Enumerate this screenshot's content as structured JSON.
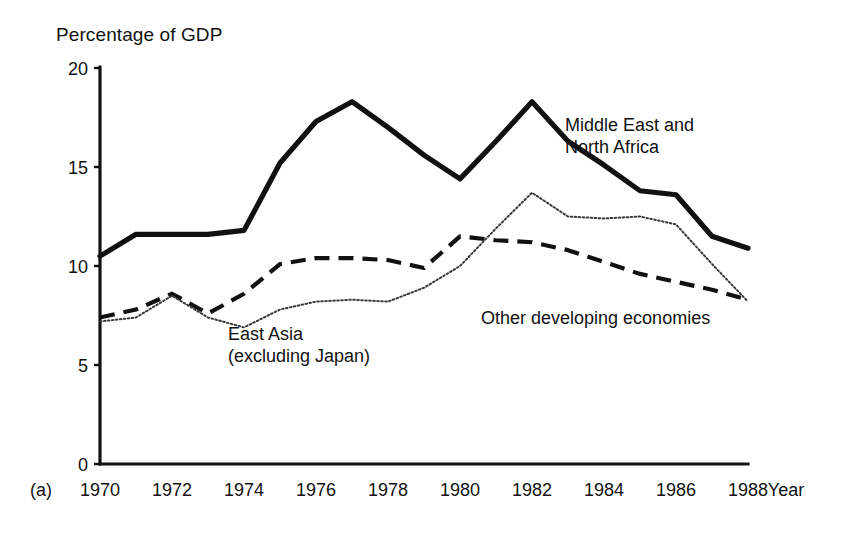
{
  "figure": {
    "panel_label": "(a)",
    "y_axis_title": "Percentage of GDP",
    "x_axis_title": "Year"
  },
  "chart_data": {
    "type": "line",
    "title": "Percentage of GDP",
    "xlabel": "Year",
    "ylabel": "Percentage of GDP",
    "xlim": [
      1970,
      1988
    ],
    "ylim": [
      0,
      20
    ],
    "grid": false,
    "legend": "inline-annotations",
    "x": [
      1970,
      1971,
      1972,
      1973,
      1974,
      1975,
      1976,
      1977,
      1978,
      1979,
      1980,
      1981,
      1982,
      1983,
      1984,
      1985,
      1986,
      1987,
      1988
    ],
    "xticks": [
      1970,
      1972,
      1974,
      1976,
      1978,
      1980,
      1982,
      1984,
      1986,
      1988
    ],
    "xtick_labels": [
      "1970",
      "1972",
      "1974",
      "1976",
      "1978",
      "1980",
      "1982",
      "1984",
      "1986",
      "1988"
    ],
    "yticks": [
      0,
      5,
      10,
      15,
      20
    ],
    "ytick_labels": [
      "0",
      "5",
      "10",
      "15",
      "20"
    ],
    "series": [
      {
        "name": "Middle East and North Africa",
        "style": "solid",
        "label_lines": [
          "Middle East and",
          "North Africa"
        ],
        "values": [
          10.5,
          11.6,
          11.6,
          11.6,
          11.8,
          15.2,
          17.3,
          18.3,
          17.0,
          15.6,
          14.4,
          16.3,
          18.3,
          16.3,
          15.1,
          13.8,
          13.6,
          11.5,
          10.9
        ]
      },
      {
        "name": "East Asia (excluding Japan)",
        "style": "dashed",
        "label_lines": [
          "East Asia",
          "(excluding Japan)"
        ],
        "values": [
          7.4,
          7.8,
          8.6,
          7.6,
          8.6,
          10.1,
          10.4,
          10.4,
          10.3,
          9.9,
          11.5,
          11.3,
          11.2,
          10.8,
          10.2,
          9.6,
          9.2,
          8.8,
          8.3
        ]
      },
      {
        "name": "Other developing economies",
        "style": "dotted",
        "label_lines": [
          "Other developing economies"
        ],
        "values": [
          7.2,
          7.4,
          8.5,
          7.4,
          6.9,
          7.8,
          8.2,
          8.3,
          8.2,
          8.9,
          10.0,
          11.9,
          13.7,
          12.5,
          12.4,
          12.5,
          12.1,
          10.1,
          8.2
        ]
      }
    ]
  }
}
